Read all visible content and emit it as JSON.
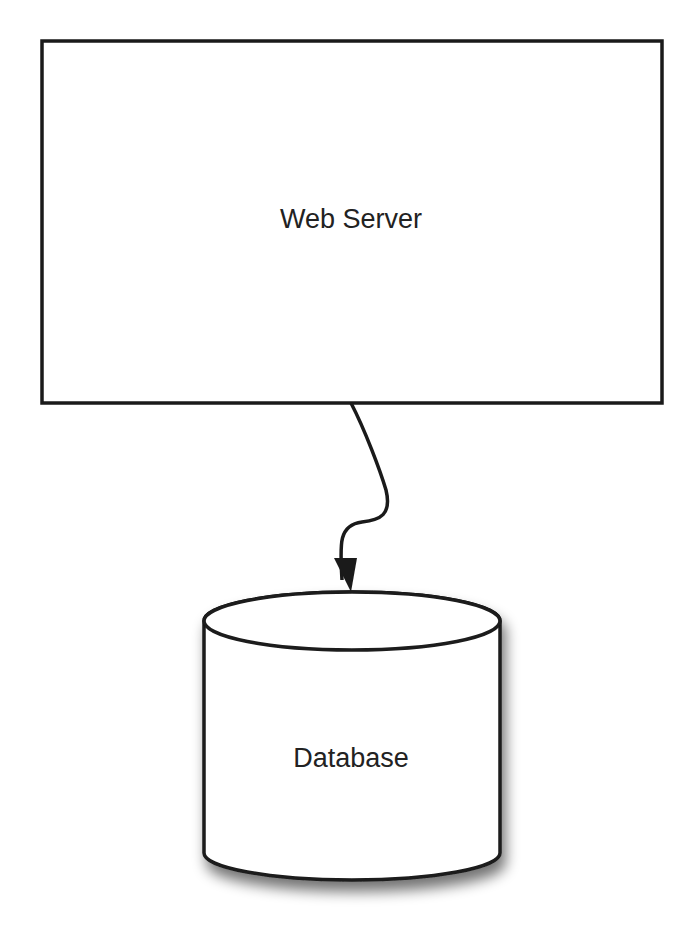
{
  "diagram": {
    "nodes": [
      {
        "id": "web-server",
        "shape": "rectangle",
        "label": "Web Server"
      },
      {
        "id": "database",
        "shape": "cylinder",
        "label": "Database"
      }
    ],
    "edges": [
      {
        "from": "web-server",
        "to": "database",
        "style": "curved-arrow"
      }
    ],
    "colors": {
      "stroke": "#1a1a1a",
      "fill": "#ffffff",
      "text": "#222222",
      "shadow": "#9a9a9a"
    }
  }
}
